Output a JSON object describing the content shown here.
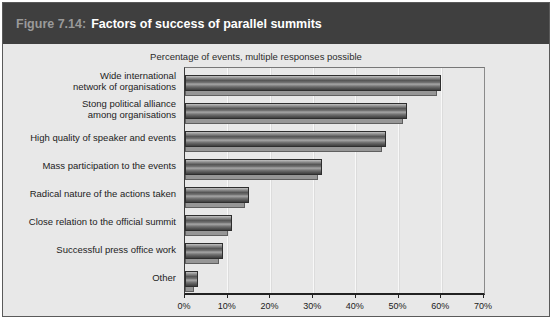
{
  "header": {
    "figure_label": "Figure 7.14:",
    "title": "Factors of success of parallel summits"
  },
  "chart_data": {
    "type": "bar",
    "orientation": "horizontal",
    "title": "Factors of success of parallel summits",
    "subtitle": "Percentage of events, multiple responses possible",
    "categories": [
      "Wide international network of organisations",
      "Stong political alliance among organisations",
      "High quality of speaker and events",
      "Mass participation to the events",
      "Radical nature of the actions taken",
      "Close relation to the official summit",
      "Successful press office work",
      "Other"
    ],
    "category_display_lines": [
      [
        "Wide international",
        "network of organisations"
      ],
      [
        "Stong political alliance",
        "among organisations"
      ],
      [
        "High quality of speaker and events"
      ],
      [
        "Mass participation to the events"
      ],
      [
        "Radical nature of the actions taken"
      ],
      [
        "Close relation to the official summit"
      ],
      [
        "Successful press office work"
      ],
      [
        "Other"
      ]
    ],
    "values": [
      60,
      52,
      47,
      32,
      15,
      11,
      9,
      3
    ],
    "unit": "%",
    "xlim": [
      0,
      70
    ],
    "x_ticks": [
      "0%",
      "10%",
      "20%",
      "30%",
      "40%",
      "50%",
      "60%",
      "70%"
    ],
    "grid": "vertical gridlines every 10%",
    "legend": "none"
  },
  "colors": {
    "title_bar_bg": "#3f3f3f",
    "figure_label_text": "#9a9a9a",
    "title_text": "#ffffff",
    "panel_bg": "#e8e8e8",
    "bar_mid": "#6e6e6e",
    "bar_highlight": "#b5b5b5",
    "bar_shadow_fill": "#969696",
    "axis_line": "#222222",
    "label_text": "#1c1c1c"
  }
}
